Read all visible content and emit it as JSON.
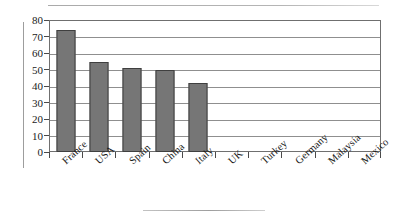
{
  "chart_data": {
    "type": "bar",
    "title": "",
    "subtitle": "",
    "xlabel": "",
    "ylabel": "",
    "categories": [
      "France",
      "USA",
      "Spain",
      "China",
      "Italy",
      "UK",
      "Turkey",
      "Germany",
      "Malaysia",
      "Mexico"
    ],
    "values": [
      74,
      54.5,
      51,
      50,
      42,
      0,
      0,
      0,
      0,
      0
    ],
    "ylim": [
      0,
      80
    ],
    "yticks": [
      0,
      10,
      20,
      30,
      40,
      50,
      60,
      70,
      80
    ],
    "ytick_labels": [
      "0",
      "10",
      "20",
      "30",
      "40",
      "50",
      "60",
      "70",
      "80"
    ],
    "grid": true,
    "legend": false,
    "legend_position": "none",
    "series": [
      {
        "name": "",
        "values": [
          74,
          54.5,
          51,
          50,
          42,
          0,
          0,
          0,
          0,
          0
        ]
      }
    ],
    "annotations": [],
    "colors": {
      "bar_fill": "#767676",
      "bar_border": "#3f3f3f",
      "gridline": "#8f8f8f",
      "axis": "#6f6f6f",
      "text": "#1a1a1a",
      "background": "#ffffff",
      "rule": "#b9b9b9"
    }
  }
}
